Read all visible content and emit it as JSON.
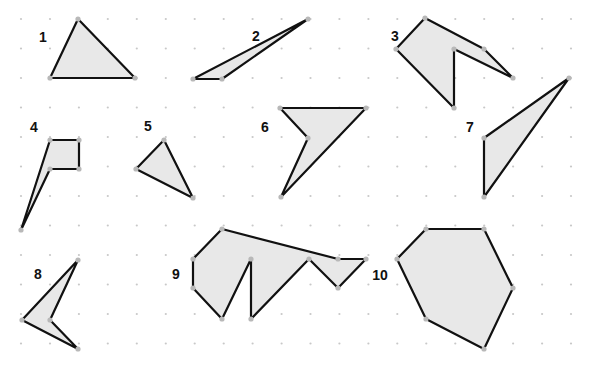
{
  "diagram": {
    "colors": {
      "background": "#ffffff",
      "grid_dot": "#c8c8c8",
      "fill": "#e8e8e8",
      "stroke": "#111111",
      "vertex": "#b8b8b8",
      "label": "#111111"
    },
    "grid": {
      "x_start": 21,
      "y_start": 19,
      "spacing_x": 28.95,
      "spacing_y": 29.5,
      "cols": 20,
      "rows": 12
    },
    "shapes": [
      {
        "label": "1",
        "label_pos": [
          43,
          42
        ],
        "points": [
          [
            78,
            19
          ],
          [
            135,
            78
          ],
          [
            50,
            78
          ]
        ]
      },
      {
        "label": "2",
        "label_pos": [
          256,
          41
        ],
        "points": [
          [
            308,
            19
          ],
          [
            222,
            79
          ],
          [
            193,
            79
          ]
        ]
      },
      {
        "label": "3",
        "label_pos": [
          395,
          41
        ],
        "points": [
          [
            425,
            18
          ],
          [
            484,
            49
          ],
          [
            513,
            78
          ],
          [
            454,
            49
          ],
          [
            454,
            108
          ],
          [
            396,
            49
          ]
        ]
      },
      {
        "label": "4",
        "label_pos": [
          34,
          132
        ],
        "points": [
          [
            50,
            140
          ],
          [
            79,
            140
          ],
          [
            79,
            169
          ],
          [
            50,
            169
          ],
          [
            21,
            230
          ]
        ]
      },
      {
        "label": "5",
        "label_pos": [
          148,
          131
        ],
        "points": [
          [
            164,
            140
          ],
          [
            193,
            198
          ],
          [
            136,
            169
          ]
        ]
      },
      {
        "label": "6",
        "label_pos": [
          265,
          132
        ],
        "points": [
          [
            280,
            108
          ],
          [
            366,
            108
          ],
          [
            281,
            197
          ],
          [
            308,
            138
          ]
        ]
      },
      {
        "label": "7",
        "label_pos": [
          470,
          132
        ],
        "points": [
          [
            569,
            78
          ],
          [
            484,
            197
          ],
          [
            484,
            138
          ]
        ]
      },
      {
        "label": "8",
        "label_pos": [
          38,
          279
        ],
        "points": [
          [
            78,
            260
          ],
          [
            50,
            320
          ],
          [
            78,
            349
          ],
          [
            22,
            320
          ]
        ]
      },
      {
        "label": "9",
        "label_pos": [
          176,
          279
        ],
        "points": [
          [
            222,
            229
          ],
          [
            338,
            259
          ],
          [
            366,
            259
          ],
          [
            338,
            288
          ],
          [
            309,
            259
          ],
          [
            251,
            319
          ],
          [
            251,
            259
          ],
          [
            222,
            319
          ],
          [
            193,
            288
          ],
          [
            193,
            259
          ]
        ]
      },
      {
        "label": "10",
        "label_pos": [
          380,
          280
        ],
        "points": [
          [
            426,
            229
          ],
          [
            484,
            229
          ],
          [
            513,
            288
          ],
          [
            484,
            349
          ],
          [
            426,
            319
          ],
          [
            397,
            259
          ]
        ]
      }
    ]
  }
}
